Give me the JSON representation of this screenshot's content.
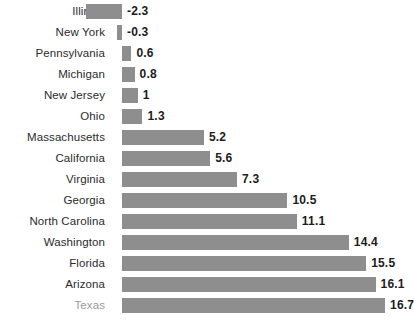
{
  "chart_data": {
    "type": "bar",
    "orientation": "horizontal",
    "title": "",
    "xlabel": "",
    "ylabel": "",
    "grid": false,
    "legend": false,
    "zero_baseline": true,
    "xlim": [
      -2.3,
      16.7
    ],
    "categories": [
      "Illinois",
      "New York",
      "Pennsylvania",
      "Michigan",
      "New Jersey",
      "Ohio",
      "Massachusetts",
      "California",
      "Virginia",
      "Georgia",
      "North Carolina",
      "Washington",
      "Florida",
      "Arizona",
      "Texas"
    ],
    "values": [
      -2.3,
      -0.3,
      0.6,
      0.8,
      1,
      1.3,
      5.2,
      5.6,
      7.3,
      10.5,
      11.1,
      14.4,
      15.5,
      16.1,
      16.7
    ],
    "value_labels": [
      "-2.3",
      "-0.3",
      "0.6",
      "0.8",
      "1",
      "1.3",
      "5.2",
      "5.6",
      "7.3",
      "10.5",
      "11.1",
      "14.4",
      "15.5",
      "16.1",
      "16.7"
    ],
    "highlighted_category": "Texas",
    "colors": {
      "bar": "#8e8e8e",
      "label": "#2b2b2b",
      "label_highlight": "#9a9a9a",
      "value": "#1c1c1c",
      "background": "#ffffff"
    }
  }
}
